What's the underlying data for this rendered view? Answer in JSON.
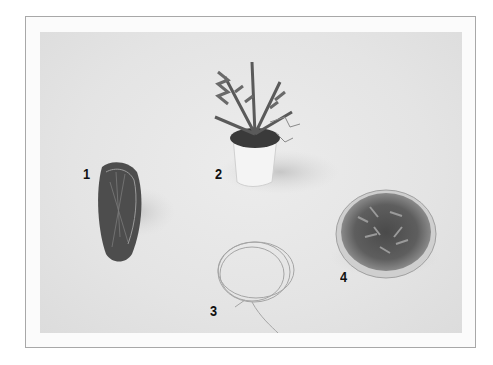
{
  "figure": {
    "items": [
      {
        "label": "1",
        "subject": "root ball wrapped in fibrous roots"
      },
      {
        "label": "2",
        "subject": "fern-like plant in a white pot"
      },
      {
        "label": "3",
        "subject": "coil of thin twine"
      },
      {
        "label": "4",
        "subject": "shallow glass dish filled with moss"
      }
    ]
  }
}
